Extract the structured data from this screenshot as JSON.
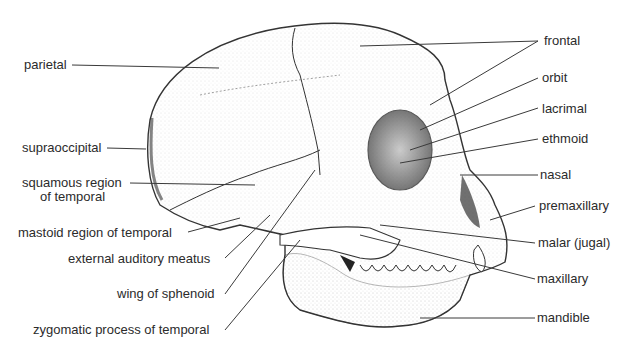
{
  "figure": {
    "labels_left": [
      {
        "id": "parietal",
        "text": "parietal"
      },
      {
        "id": "supraoccipital",
        "text": "supraoccipital"
      },
      {
        "id": "squamous",
        "text": "squamous region",
        "text2": "of temporal"
      },
      {
        "id": "mastoid",
        "text": "mastoid region of temporal"
      },
      {
        "id": "meatus",
        "text": "external auditory meatus"
      },
      {
        "id": "sphenoid",
        "text": "wing of sphenoid"
      },
      {
        "id": "zygomatic",
        "text": "zygomatic process of temporal"
      }
    ],
    "labels_right": [
      {
        "id": "frontal",
        "text": "frontal"
      },
      {
        "id": "orbit",
        "text": "orbit"
      },
      {
        "id": "lacrimal",
        "text": "lacrimal"
      },
      {
        "id": "ethmoid",
        "text": "ethmoid"
      },
      {
        "id": "nasal",
        "text": "nasal"
      },
      {
        "id": "premaxillary",
        "text": "premaxillary"
      },
      {
        "id": "malar",
        "text": "malar (jugal)"
      },
      {
        "id": "maxillary",
        "text": "maxillary"
      },
      {
        "id": "mandible",
        "text": "mandible"
      }
    ],
    "colors": {
      "line": "#3a3a3a",
      "ink": "#2b2b2b",
      "shade": "#555555",
      "background": "#ffffff"
    }
  }
}
